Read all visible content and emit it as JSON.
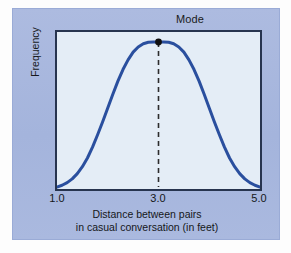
{
  "figure": {
    "panel_color": "#a9b8de",
    "plot_background": "#e4edf6",
    "plot_border_color": "#27344f"
  },
  "chart_data": {
    "type": "line",
    "title": "",
    "subtitle": "",
    "xlabel_line1": "Distance between pairs",
    "xlabel_line2": "in casual conversation (in feet)",
    "ylabel": "Frequency",
    "curve_color": "#2a4f9e",
    "grid": false,
    "legend": "none",
    "xlim": [
      1.0,
      5.0
    ],
    "ylim": [
      0,
      1
    ],
    "xticks": [
      "1.0",
      "3.0",
      "5.0"
    ],
    "xtick_values": [
      1.0,
      3.0,
      5.0
    ],
    "yticks": [],
    "annotations": [
      {
        "label": "Mode",
        "x": 3.0,
        "y": 1.0,
        "marker": "filled-dot",
        "guide": "dashed-vertical-line"
      }
    ],
    "x": [
      1.0,
      1.1,
      1.2,
      1.3,
      1.4,
      1.5,
      1.6,
      1.7,
      1.8,
      1.9,
      2.0,
      2.1,
      2.2,
      2.3,
      2.4,
      2.5,
      2.6,
      2.7,
      2.8,
      2.9,
      3.0,
      3.1,
      3.2,
      3.3,
      3.4,
      3.5,
      3.6,
      3.7,
      3.8,
      3.9,
      4.0,
      4.1,
      4.2,
      4.3,
      4.4,
      4.5,
      4.6,
      4.7,
      4.8,
      4.9,
      5.0
    ],
    "values": [
      0.0,
      0.012,
      0.03,
      0.056,
      0.092,
      0.14,
      0.2,
      0.275,
      0.36,
      0.45,
      0.545,
      0.64,
      0.73,
      0.81,
      0.877,
      0.93,
      0.966,
      0.988,
      0.998,
      1.0,
      1.0,
      1.0,
      0.998,
      0.988,
      0.966,
      0.93,
      0.877,
      0.81,
      0.73,
      0.64,
      0.545,
      0.45,
      0.36,
      0.275,
      0.2,
      0.14,
      0.092,
      0.056,
      0.03,
      0.012,
      0.0
    ]
  }
}
